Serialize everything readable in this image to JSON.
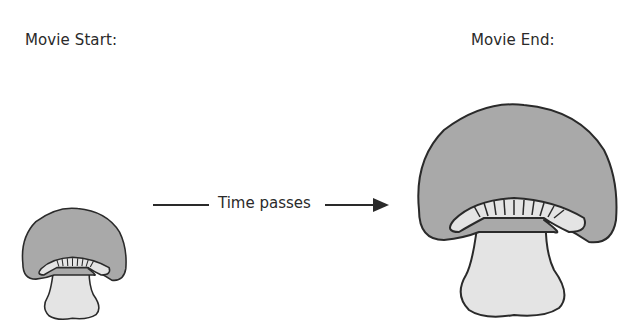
{
  "diagram": {
    "start_label": "Movie Start:",
    "end_label": "Movie End:",
    "transition_label": "Time passes",
    "colors": {
      "cap": "#a9a9a9",
      "stem": "#e4e4e4",
      "outline": "#2a2a2a",
      "background": "#ffffff"
    },
    "icons": {
      "start": "small-mushroom-icon",
      "end": "large-mushroom-icon",
      "transition": "right-arrow-icon"
    }
  }
}
